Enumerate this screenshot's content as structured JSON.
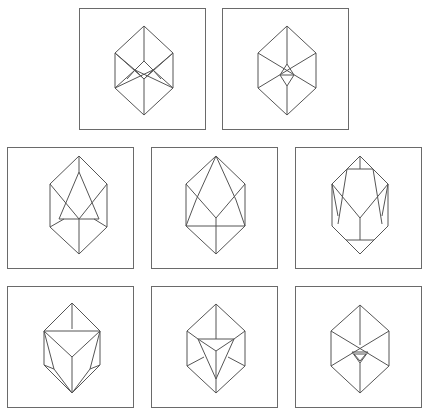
{
  "figure": {
    "stroke_color": "#555555",
    "frame_color": "#6a6a6a",
    "panels": [
      {
        "id": "p1",
        "name": "cube-with-center-diamond"
      },
      {
        "id": "p2",
        "name": "cube-with-small-center-triangle"
      },
      {
        "id": "p3",
        "name": "crystal-with-large-triangle-facet"
      },
      {
        "id": "p4",
        "name": "crystal-with-pointed-upper-facets"
      },
      {
        "id": "p5",
        "name": "crystal-with-truncated-corners"
      },
      {
        "id": "p6",
        "name": "crystal-with-inverted-triangle-facet"
      },
      {
        "id": "p7",
        "name": "cube-with-inverted-triangle-center"
      },
      {
        "id": "p8",
        "name": "cube-with-small-inverted-triangle"
      }
    ]
  }
}
